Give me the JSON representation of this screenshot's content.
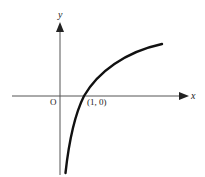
{
  "diagram": {
    "type": "function-graph",
    "function": "y = log x",
    "axes": {
      "x_label": "x",
      "y_label": "y",
      "origin_label": "O"
    },
    "point": {
      "label": "(1, 0)",
      "x": 1,
      "y": 0
    },
    "colors": {
      "axis": "#555555",
      "curve": "#111111",
      "text": "#222222"
    }
  }
}
